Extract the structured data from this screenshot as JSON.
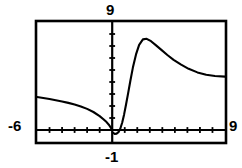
{
  "figure": {
    "name": "graphing-calculator-viewing-window",
    "background_color": "#ffffff",
    "ink_color": "#000000"
  },
  "labels": {
    "ymax": "9",
    "ymin": "-1",
    "xmin": "-6",
    "xmax": "9"
  },
  "chart_data": {
    "type": "line",
    "title": "",
    "xlabel": "",
    "ylabel": "",
    "xlim": [
      -6,
      9
    ],
    "ylim": [
      -1,
      9
    ],
    "grid": false,
    "legend": null,
    "axes": {
      "x_axis_at_y": 0,
      "y_axis_at_x": 0,
      "x_tick_step": 1,
      "y_tick_step": 1,
      "x_tick_count": 15,
      "y_tick_count": 10,
      "frame_border": true
    },
    "series": [
      {
        "name": "curve-left-branch",
        "x": [
          -6.0,
          -5.5,
          -5.0,
          -4.5,
          -4.0,
          -3.5,
          -3.0,
          -2.5,
          -2.0,
          -1.5,
          -1.0,
          -0.7,
          -0.45,
          -0.25,
          -0.1,
          -0.02
        ],
        "y": [
          2.75,
          2.66,
          2.58,
          2.48,
          2.38,
          2.26,
          2.12,
          1.96,
          1.76,
          1.5,
          1.16,
          0.9,
          0.66,
          0.42,
          0.18,
          0.04
        ]
      },
      {
        "name": "curve-right-branch",
        "x": [
          0.05,
          0.2,
          0.35,
          0.5,
          0.65,
          0.8,
          0.95,
          1.1,
          1.25,
          1.45,
          1.65,
          1.9,
          2.15,
          2.45,
          2.75,
          3.1,
          3.5,
          3.9,
          4.4,
          4.9,
          5.5,
          6.1,
          6.8,
          7.5,
          8.2,
          9.0
        ],
        "y": [
          -0.22,
          -0.32,
          -0.3,
          -0.18,
          0.12,
          0.62,
          1.3,
          2.1,
          2.95,
          4.1,
          5.2,
          6.3,
          7.1,
          7.55,
          7.6,
          7.4,
          7.05,
          6.7,
          6.25,
          5.85,
          5.45,
          5.1,
          4.8,
          4.6,
          4.5,
          4.45
        ]
      }
    ],
    "features": {
      "peak_x": 2.75,
      "peak_y": 7.6,
      "minimum_x": 0.28,
      "minimum_y": -0.33,
      "x_intercept": 0.0,
      "right_asymptote_y": 4.45
    }
  }
}
